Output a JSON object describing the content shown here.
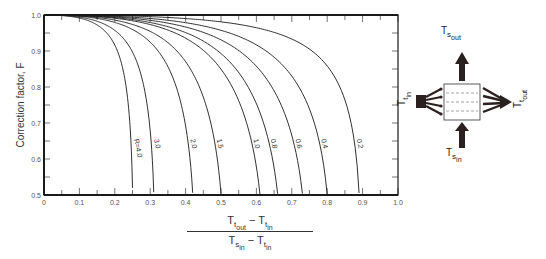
{
  "chart_data": {
    "type": "line",
    "title": "",
    "ylabel": "Correction factor, F",
    "xlabel": "(T_t_out − T_t_in) / (T_s_in − T_t_in)",
    "xlim": [
      0,
      1.0
    ],
    "ylim": [
      0.5,
      1.0
    ],
    "x_ticks": [
      "0",
      "0.1",
      "0.2",
      "0.3",
      "0.4",
      "0.5",
      "0.6",
      "0.7",
      "0.8",
      "0.9",
      "1.0"
    ],
    "y_ticks": [
      "0.5",
      "0.6",
      "0.7",
      "0.8",
      "0.9",
      "1.0"
    ],
    "grid": false,
    "legend": "inline curve labels",
    "series": [
      {
        "name": "R=4.0",
        "label": "R=4.0",
        "R": 4.0,
        "x_at_F05": 0.25
      },
      {
        "name": "3.0",
        "label": "3.0",
        "R": 3.0,
        "x_at_F05": 0.31
      },
      {
        "name": "2.0",
        "label": "2.0",
        "R": 2.0,
        "x_at_F05": 0.42
      },
      {
        "name": "1.5",
        "label": "1.5",
        "R": 1.5,
        "x_at_F05": 0.5
      },
      {
        "name": "1.0",
        "label": "1.0",
        "R": 1.0,
        "x_at_F05": 0.61
      },
      {
        "name": "0.8",
        "label": "0.8",
        "R": 0.8,
        "x_at_F05": 0.66
      },
      {
        "name": "0.6",
        "label": "0.6",
        "R": 0.6,
        "x_at_F05": 0.73
      },
      {
        "name": "0.4",
        "label": "0.4",
        "R": 0.4,
        "x_at_F05": 0.8
      },
      {
        "name": "0.2",
        "label": "0.2",
        "R": 0.2,
        "x_at_F05": 0.89
      }
    ]
  },
  "axis": {
    "ylabel": "Correction factor, F",
    "xlabel": {
      "num_a": "T",
      "num_a_sub": "t",
      "num_a_subsub": "out",
      "minus": " − ",
      "num_b": "T",
      "num_b_sub": "t",
      "num_b_subsub": "in",
      "den_a": "T",
      "den_a_sub": "s",
      "den_a_subsub": "in",
      "den_b": "T",
      "den_b_sub": "t",
      "den_b_subsub": "in"
    }
  },
  "diagram": {
    "ts_out": {
      "base": "T",
      "sub": "s",
      "subsub": "out"
    },
    "ts_in": {
      "base": "T",
      "sub": "s",
      "subsub": "in"
    },
    "tt_in": {
      "base": "T",
      "sub": "t",
      "subsub": "in"
    },
    "tt_out": {
      "base": "T",
      "sub": "t",
      "subsub": "out"
    }
  },
  "colors": {
    "line": "#1a1a1a",
    "arrow": "#2b2020",
    "text": "#333333"
  }
}
